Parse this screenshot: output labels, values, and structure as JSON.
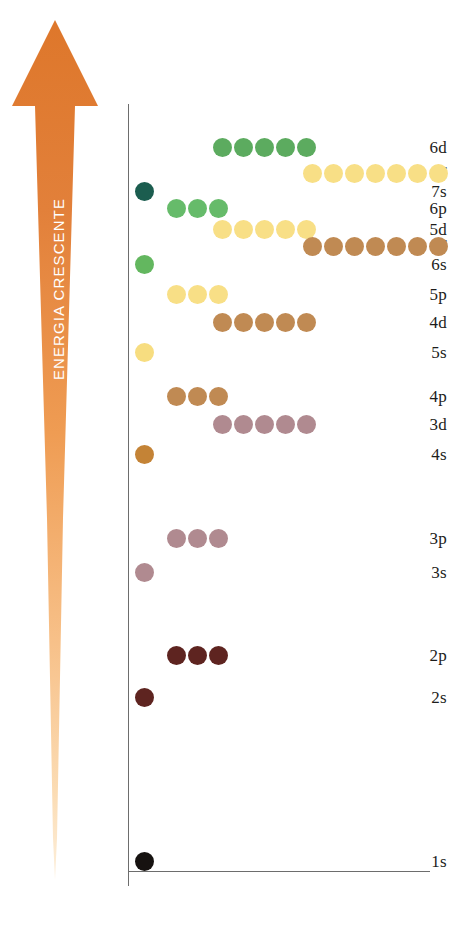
{
  "diagram": {
    "arrow_label": "ENERGIA CRESCENTE",
    "arrow_color_top": "#e07b2f",
    "arrow_color_bottom": "#fdeacb",
    "axis_color": "#6d6d6d"
  },
  "chart_data": {
    "type": "scatter",
    "title": "",
    "xlabel": "",
    "ylabel": "ENERGIA CRESCENTE",
    "grid": false,
    "legend": "none",
    "note": "Each dot represents one orbital of the subshell; rows ordered by increasing energy upward (Aufbau / Madelung ordering).",
    "levels": [
      {
        "label": "6d",
        "y": 148,
        "count": 5,
        "kind": "d",
        "color": "#5cab5f",
        "x_start": 213
      },
      {
        "label": "5f",
        "y": 174,
        "count": 7,
        "kind": "f",
        "color": "#f8df86",
        "x_start": 303
      },
      {
        "label": "7s",
        "y": 192,
        "count": 1,
        "kind": "s",
        "color": "#1b5d4f",
        "x_start": 135
      },
      {
        "label": "6p",
        "y": 209,
        "count": 3,
        "kind": "p",
        "color": "#66bb6a",
        "x_start": 167
      },
      {
        "label": "5d",
        "y": 230,
        "count": 5,
        "kind": "d",
        "color": "#f8df86",
        "x_start": 213
      },
      {
        "label": "4f",
        "y": 247,
        "count": 7,
        "kind": "f",
        "color": "#c08a53",
        "x_start": 303
      },
      {
        "label": "6s",
        "y": 265,
        "count": 1,
        "kind": "s",
        "color": "#63b75f",
        "x_start": 135
      },
      {
        "label": "5p",
        "y": 295,
        "count": 3,
        "kind": "p",
        "color": "#f8df86",
        "x_start": 167
      },
      {
        "label": "4d",
        "y": 323,
        "count": 5,
        "kind": "d",
        "color": "#c08a53",
        "x_start": 213
      },
      {
        "label": "5s",
        "y": 353,
        "count": 1,
        "kind": "s",
        "color": "#f7dd80",
        "x_start": 135
      },
      {
        "label": "4p",
        "y": 397,
        "count": 3,
        "kind": "p",
        "color": "#c08a53",
        "x_start": 167
      },
      {
        "label": "3d",
        "y": 425,
        "count": 5,
        "kind": "d",
        "color": "#b08a90",
        "x_start": 213
      },
      {
        "label": "4s",
        "y": 455,
        "count": 1,
        "kind": "s",
        "color": "#c48336",
        "x_start": 135
      },
      {
        "label": "3p",
        "y": 539,
        "count": 3,
        "kind": "p",
        "color": "#b08a90",
        "x_start": 167
      },
      {
        "label": "3s",
        "y": 573,
        "count": 1,
        "kind": "s",
        "color": "#b08a90",
        "x_start": 135
      },
      {
        "label": "2p",
        "y": 656,
        "count": 3,
        "kind": "p",
        "color": "#5e2420",
        "x_start": 167
      },
      {
        "label": "2s",
        "y": 698,
        "count": 1,
        "kind": "s",
        "color": "#5e2420",
        "x_start": 135
      },
      {
        "label": "1s",
        "y": 862,
        "count": 1,
        "kind": "s",
        "color": "#161210",
        "x_start": 135
      }
    ]
  }
}
